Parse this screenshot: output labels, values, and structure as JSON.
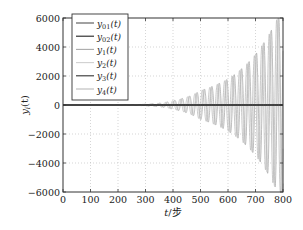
{
  "chart_data": {
    "type": "line",
    "title": "",
    "xlabel": "t/步",
    "ylabel": "y_i(t)",
    "xlim": [
      0,
      800
    ],
    "ylim": [
      -6000,
      6000
    ],
    "grid": true,
    "legend_position": "upper left",
    "x_ticks": [
      "0",
      "100",
      "200",
      "300",
      "400",
      "500",
      "600",
      "700",
      "800"
    ],
    "y_ticks": [
      "6000",
      "4000",
      "2000",
      "0",
      "-2000",
      "-4000",
      "-6000"
    ],
    "legend": [
      "y01(t)",
      "y02(t)",
      "y1(t)",
      "y2(t)",
      "y3(t)",
      "y4(t)"
    ],
    "series": [
      {
        "name": "y01(t)",
        "color": "#555555",
        "description": "reference signal, approximately 0 throughout",
        "values_at_x": {
          "0": 0,
          "800": 0
        }
      },
      {
        "name": "y02(t)",
        "color": "#222222",
        "description": "reference signal, approximately 0 throughout",
        "values_at_x": {
          "0": 0,
          "800": 0
        }
      },
      {
        "name": "y1(t)",
        "color": "#aaaaaa",
        "description": "oscillation with exponentially growing amplitude",
        "envelope": {
          "x": [
            0,
            300,
            400,
            500,
            600,
            700,
            780,
            800
          ],
          "amplitude": [
            0,
            50,
            300,
            1000,
            1800,
            3500,
            6000,
            6000
          ]
        },
        "period_steps": 27
      },
      {
        "name": "y2(t)",
        "color": "#cccccc",
        "description": "oscillation with exponentially growing amplitude",
        "envelope": {
          "x": [
            0,
            300,
            400,
            500,
            600,
            700,
            780,
            800
          ],
          "amplitude": [
            0,
            50,
            300,
            1000,
            1800,
            3500,
            6000,
            6000
          ]
        },
        "period_steps": 27
      },
      {
        "name": "y3(t)",
        "color": "#444444",
        "description": "approximately 0 throughout",
        "values_at_x": {
          "0": 0,
          "800": 0
        }
      },
      {
        "name": "y4(t)",
        "color": "#bbbbbb",
        "description": "oscillation with exponentially growing amplitude",
        "envelope": {
          "x": [
            0,
            300,
            400,
            500,
            600,
            700,
            780,
            800
          ],
          "amplitude": [
            0,
            50,
            300,
            1000,
            1800,
            3500,
            6000,
            6000
          ]
        },
        "period_steps": 27
      }
    ]
  },
  "axes": {
    "xlabel_t": "t",
    "xlabel_unit": "/步",
    "ylabel_y": "y",
    "ylabel_sub": "i",
    "ylabel_arg": "(t)"
  },
  "legend_items": [
    {
      "base": "y",
      "sub": "01",
      "arg": "(t)",
      "color": "#555555"
    },
    {
      "base": "y",
      "sub": "02",
      "arg": "(t)",
      "color": "#222222"
    },
    {
      "base": "y",
      "sub": "1",
      "arg": "(t)",
      "color": "#aaaaaa"
    },
    {
      "base": "y",
      "sub": "2",
      "arg": "(t)",
      "color": "#d0d0d0"
    },
    {
      "base": "y",
      "sub": "3",
      "arg": "(t)",
      "color": "#333333"
    },
    {
      "base": "y",
      "sub": "4",
      "arg": "(t)",
      "color": "#bbbbbb"
    }
  ]
}
